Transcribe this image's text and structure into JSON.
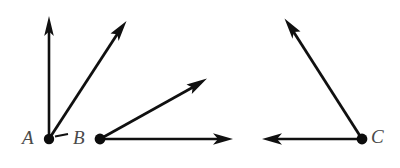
{
  "figure": {
    "type": "geometry-diagram",
    "background_color": "#ffffff",
    "stroke_color": "#101010",
    "label_color": "#4a4a4a",
    "width": 400,
    "height": 168,
    "baseline_y": 139,
    "vertices": [
      {
        "id": "A",
        "label": "A",
        "x": 49,
        "y": 139,
        "dot_radius": 5,
        "label_x": 22,
        "label_y": 129,
        "rays": [
          {
            "id": "A-up",
            "name": "ray-a-vertical",
            "to_x": 49,
            "to_y": 17,
            "direction": "up",
            "arrowhead": true
          },
          {
            "id": "A-diagonal",
            "name": "ray-a-diagonal",
            "to_x": 126,
            "to_y": 22,
            "direction": "up-right",
            "arrowhead": true
          }
        ],
        "tick": {
          "name": "angle-tick-mark",
          "x1": 55,
          "y1": 136,
          "x2": 67,
          "y2": 134
        }
      },
      {
        "id": "B",
        "label": "B",
        "x": 100,
        "y": 139,
        "dot_radius": 5,
        "label_x": 73,
        "label_y": 129,
        "rays": [
          {
            "id": "B-diagonal",
            "name": "ray-b-diagonal",
            "to_x": 206,
            "to_y": 79,
            "direction": "up-right",
            "arrowhead": true
          },
          {
            "id": "B-horizontal",
            "name": "ray-b-horizontal",
            "to_x": 232,
            "to_y": 139,
            "direction": "right",
            "arrowhead": true
          }
        ],
        "tick": null
      },
      {
        "id": "C",
        "label": "C",
        "x": 362,
        "y": 139,
        "dot_radius": 5,
        "label_x": 370,
        "label_y": 128,
        "rays": [
          {
            "id": "C-diagonal",
            "name": "ray-c-diagonal",
            "to_x": 285,
            "to_y": 19,
            "direction": "up-left",
            "arrowhead": true
          },
          {
            "id": "C-horizontal",
            "name": "ray-c-horizontal",
            "to_x": 263,
            "to_y": 139,
            "direction": "left",
            "arrowhead": true
          }
        ],
        "tick": null
      }
    ]
  }
}
